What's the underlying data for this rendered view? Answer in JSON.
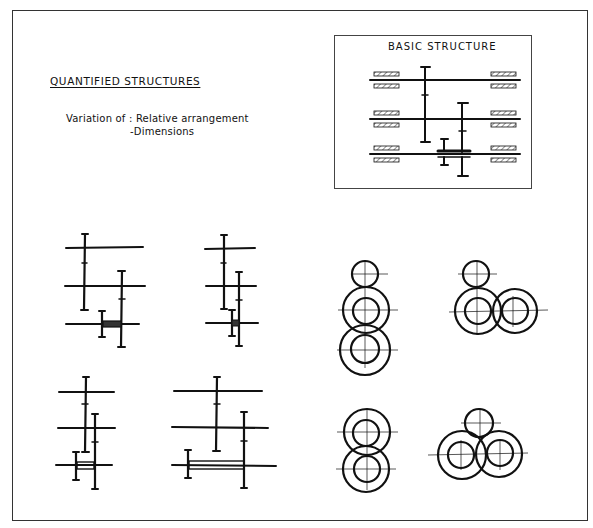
{
  "heading": "QUANTIFIED STRUCTURES",
  "variation": {
    "line1": "Variation of : Relative arrangement",
    "line2": "-Dimensions"
  },
  "basic_structure": {
    "title": "BASIC STRUCTURE",
    "shafts": 3,
    "bearings_per_shaft": 2
  },
  "schematic_variants": [
    {
      "name": "variant-1",
      "position": "top-left"
    },
    {
      "name": "variant-2",
      "position": "top-middle"
    },
    {
      "name": "variant-3",
      "position": "bottom-left"
    },
    {
      "name": "variant-4",
      "position": "bottom-middle"
    }
  ],
  "gear_arrangements": [
    {
      "name": "vertical-stack-three",
      "position": "top-right-1"
    },
    {
      "name": "l-shaped-three",
      "position": "top-right-2"
    },
    {
      "name": "vertical-stack-two",
      "position": "bottom-right-1"
    },
    {
      "name": "triangular-three",
      "position": "bottom-right-2"
    }
  ],
  "colors": {
    "ink": "#111111",
    "background": "#ffffff",
    "frame": "#333333"
  }
}
